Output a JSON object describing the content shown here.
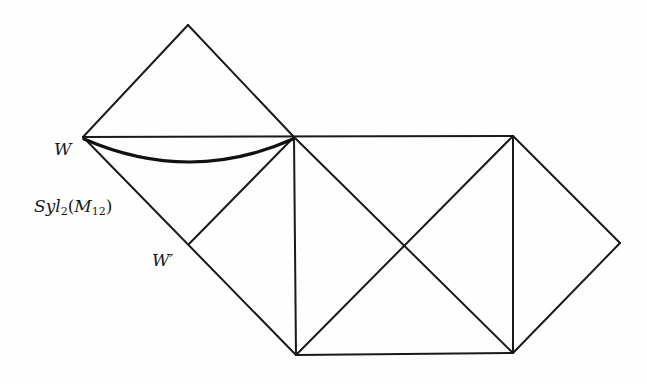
{
  "diagram": {
    "type": "geometric-complex",
    "colors": {
      "line": "#1a1a1a",
      "background": "#fefefe"
    },
    "vertices": {
      "top_apex": [
        188,
        25
      ],
      "W": [
        83,
        137
      ],
      "junction": [
        294,
        137
      ],
      "top_right": [
        513,
        136
      ],
      "right_apex": [
        620,
        243
      ],
      "W_prime": [
        189,
        244
      ],
      "bottom_left": [
        296,
        355
      ],
      "bottom_right": [
        513,
        353
      ]
    },
    "labels": {
      "W": "W",
      "W_prime": "W′",
      "syl_prefix": "Syl",
      "syl_sub": "2",
      "syl_paren_open": "(M",
      "syl_inner_sub": "12",
      "syl_paren_close": ")"
    }
  }
}
